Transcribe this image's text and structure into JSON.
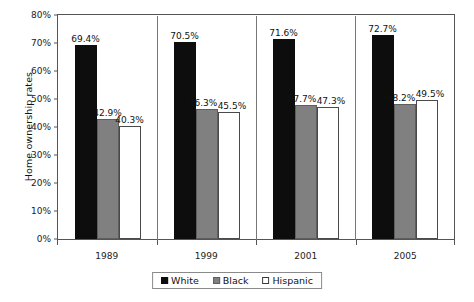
{
  "chart_data": {
    "type": "bar",
    "title": "",
    "xlabel": "",
    "ylabel": "Home ownership rates",
    "categories": [
      "1989",
      "1999",
      "2001",
      "2005"
    ],
    "ylim": [
      0,
      80
    ],
    "ytick_values": [
      0,
      10,
      20,
      30,
      40,
      50,
      60,
      70,
      80
    ],
    "ytick_labels": [
      "0%",
      "10%",
      "20%",
      "30%",
      "40%",
      "50%",
      "60%",
      "70%",
      "80%"
    ],
    "grid": false,
    "legend_position": "bottom",
    "series": [
      {
        "name": "White",
        "color": "#0d0d0d",
        "values": [
          69.4,
          70.5,
          71.6,
          72.7
        ],
        "labels": [
          "69.4%",
          "70.5%",
          "71.6%",
          "72.7%"
        ]
      },
      {
        "name": "Black",
        "color": "#808080",
        "values": [
          42.9,
          46.3,
          47.7,
          48.2
        ],
        "labels": [
          "42.9%",
          "46.3%",
          "47.7%",
          "48.2%"
        ]
      },
      {
        "name": "Hispanic",
        "color": "#ffffff",
        "values": [
          40.3,
          45.5,
          47.3,
          49.5
        ],
        "labels": [
          "40.3%",
          "45.5%",
          "47.3%",
          "49.5%"
        ]
      }
    ]
  },
  "axis": {
    "y_title": "Home ownership rates",
    "y_ticks": [
      "80%",
      "70%",
      "60%",
      "50%",
      "40%",
      "30%",
      "20%",
      "10%",
      "0%"
    ],
    "x_ticks": [
      "1989",
      "1999",
      "2001",
      "2005"
    ]
  },
  "legend": {
    "items": [
      {
        "label": "White",
        "swatch": "filled-black-square-icon"
      },
      {
        "label": "Black",
        "swatch": "filled-gray-square-icon"
      },
      {
        "label": "Hispanic",
        "swatch": "outlined-white-square-icon"
      }
    ]
  }
}
